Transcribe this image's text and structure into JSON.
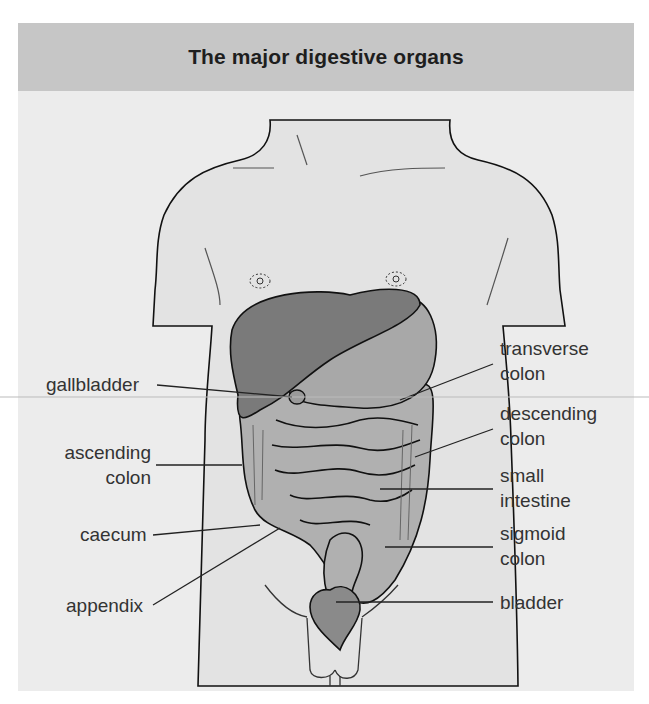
{
  "title": "The major digestive organs",
  "colors": {
    "header_bg": "#c6c6c6",
    "panel_bg": "#ececec",
    "body_fill": "#e3e3e3",
    "liver": "#7a7a7a",
    "stomach": "#a8a8a8",
    "intestine": "#b0b0b0",
    "bladder": "#8a8a8a",
    "outline": "#111111"
  },
  "labels": {
    "gallbladder": "gallbladder",
    "ascending_colon_1": "ascending",
    "ascending_colon_2": "colon",
    "caecum": "caecum",
    "appendix": "appendix",
    "transverse_colon_1": "transverse",
    "transverse_colon_2": "colon",
    "descending_colon_1": "descending",
    "descending_colon_2": "colon",
    "small_intestine_1": "small",
    "small_intestine_2": "intestine",
    "sigmoid_colon_1": "sigmoid",
    "sigmoid_colon_2": "colon",
    "bladder": "bladder"
  }
}
